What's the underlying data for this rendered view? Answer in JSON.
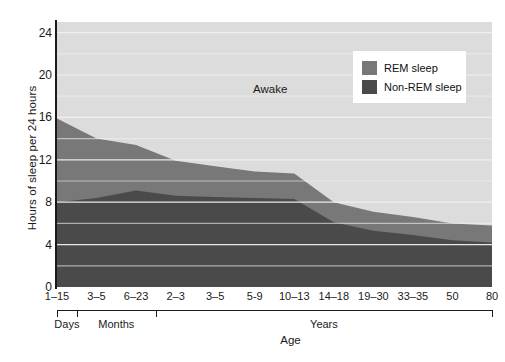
{
  "chart_data": {
    "type": "area",
    "title": "",
    "xlabel": "Age",
    "ylabel": "Hours of sleep per 24 hours",
    "ylim": [
      0,
      25
    ],
    "yticks": [
      0,
      4,
      8,
      12,
      16,
      20,
      24
    ],
    "grid": true,
    "grid_interval": 2,
    "legend_position": "upper-right",
    "stacked": true,
    "categories": [
      "1–15",
      "3–5",
      "6–23",
      "2–3",
      "3–5",
      "5-9",
      "10–13",
      "14–18",
      "19–30",
      "33–35",
      "50",
      "80"
    ],
    "group_brackets": [
      {
        "label": "Days",
        "from": 0,
        "to": 0
      },
      {
        "label": "Months",
        "from": 1,
        "to": 2
      },
      {
        "label": "Years",
        "from": 3,
        "to": 11
      }
    ],
    "series": [
      {
        "name": "Non-REM sleep",
        "color": "#4a4a4a",
        "values": [
          8.0,
          8.4,
          9.1,
          8.6,
          8.5,
          8.4,
          8.3,
          6.1,
          5.3,
          4.9,
          4.4,
          4.2
        ]
      },
      {
        "name": "REM sleep",
        "color": "#787878",
        "values": [
          7.9,
          5.6,
          4.3,
          3.3,
          2.9,
          2.5,
          2.4,
          1.9,
          1.8,
          1.7,
          1.6,
          1.6
        ]
      },
      {
        "name": "Awake",
        "color": "#dcdcdc",
        "values": [
          8.1,
          11.0,
          11.6,
          13.1,
          13.6,
          14.1,
          14.3,
          17.0,
          17.9,
          18.4,
          19.0,
          19.2
        ]
      }
    ],
    "annotations": [
      {
        "text": "Awake",
        "x_fraction": 0.49,
        "y_value": 18.7
      }
    ]
  },
  "legend": {
    "items": [
      {
        "label": "REM sleep",
        "color": "#787878",
        "swatch_name": "rem-sleep-swatch"
      },
      {
        "label": "Non-REM sleep",
        "color": "#4a4a4a",
        "swatch_name": "non-rem-sleep-swatch"
      }
    ]
  },
  "axes": {
    "y_title": "Hours of sleep per 24 hours",
    "x_title": "Age",
    "y_tick_labels": [
      "24",
      "20",
      "16",
      "12",
      "8",
      "4",
      "0"
    ],
    "x_tick_labels": [
      "1–15",
      "3–5",
      "6–23",
      "2–3",
      "3–5",
      "5-9",
      "10–13",
      "14–18",
      "19–30",
      "33–35",
      "50",
      "80"
    ],
    "group_labels": [
      "Days",
      "Months",
      "Years"
    ]
  },
  "annotations": {
    "awake_label": "Awake"
  },
  "caption": {
    "text": ""
  },
  "colors": {
    "awake": "#dcdcdc",
    "rem": "#787878",
    "non_rem": "#4a4a4a",
    "grid": "#f2f2f2",
    "axis": "#1a1a1a",
    "legend_bg": "#ffffff"
  }
}
